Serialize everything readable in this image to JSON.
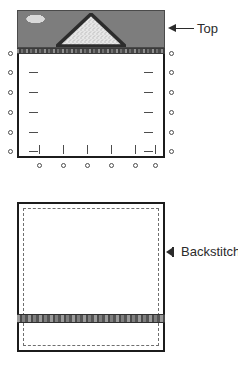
{
  "figure": {
    "callouts": [
      {
        "id": "top",
        "label": "Top",
        "arrow": "arrow-left-icon"
      },
      {
        "id": "backstitch",
        "label": "Backstitch.",
        "arrow": "arrow-left-small-icon"
      }
    ]
  },
  "upper_diagram": {
    "name": "bag-front-with-pins",
    "band": {
      "name": "printed-leaf-band",
      "motif": "triangle-applique"
    },
    "binding": {
      "name": "binding-strip"
    },
    "pins": {
      "left_count": 6,
      "right_count": 6,
      "bottom_count": 6
    }
  },
  "lower_diagram": {
    "name": "bag-lining-backstitch",
    "stitch_line": {
      "name": "dashed-stitch-line",
      "style": "dashed"
    },
    "binding": {
      "name": "binding-strip"
    }
  },
  "colors": {
    "outline": "#1c1c1c",
    "band_light": "#d4d4d4",
    "band_dark": "#8a8a8a",
    "binding": "#5d5d5d",
    "stitch": "#6f6f6f",
    "text": "#2b2b2b",
    "background": "#ffffff"
  }
}
